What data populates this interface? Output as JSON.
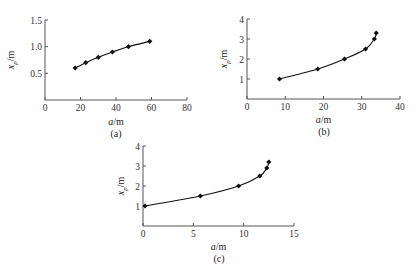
{
  "chart_data": [
    {
      "type": "line",
      "panel": "(a)",
      "xlabel": "a/m",
      "ylabel": "x_p/m",
      "xlim": [
        0,
        80
      ],
      "ylim": [
        0,
        1.5
      ],
      "xticks": [
        0,
        20,
        40,
        60,
        80
      ],
      "xtick_labels": [
        "0",
        "20",
        "40",
        "60",
        "80"
      ],
      "yticks": [
        0.5,
        1.0,
        1.5
      ],
      "ytick_labels": [
        "0.5",
        "1.0",
        "1.5"
      ],
      "grid": false,
      "marker": "diamond",
      "x": [
        17,
        23,
        30,
        38,
        47,
        59
      ],
      "y": [
        0.6,
        0.7,
        0.8,
        0.9,
        1.0,
        1.1
      ]
    },
    {
      "type": "line",
      "panel": "(b)",
      "xlabel": "a/m",
      "ylabel": "x_p/m",
      "xlim": [
        0,
        40
      ],
      "ylim": [
        0,
        4
      ],
      "xticks": [
        0,
        10,
        20,
        30,
        40
      ],
      "xtick_labels": [
        "0",
        "10",
        "20",
        "30",
        "40"
      ],
      "yticks": [
        1,
        2,
        3,
        4
      ],
      "ytick_labels": [
        "1",
        "2",
        "3",
        "4"
      ],
      "grid": false,
      "marker": "diamond",
      "x": [
        8.5,
        18.5,
        25.5,
        31,
        33.3,
        33.8
      ],
      "y": [
        1.0,
        1.5,
        2.0,
        2.5,
        3.0,
        3.3
      ]
    },
    {
      "type": "line",
      "panel": "(c)",
      "xlabel": "a/m",
      "ylabel": "x_p/m",
      "xlim": [
        0,
        15
      ],
      "ylim": [
        0,
        4
      ],
      "xticks": [
        0,
        5,
        10,
        15
      ],
      "xtick_labels": [
        "0",
        "5",
        "10",
        "15"
      ],
      "yticks": [
        1,
        2,
        3,
        4
      ],
      "ytick_labels": [
        "1",
        "2",
        "3",
        "4"
      ],
      "grid": false,
      "marker": "diamond",
      "x": [
        0.2,
        5.7,
        9.5,
        11.6,
        12.3,
        12.5
      ],
      "y": [
        1.0,
        1.5,
        2.0,
        2.5,
        2.9,
        3.2
      ]
    }
  ],
  "layout": {
    "panels": [
      {
        "x0": 45,
        "x1": 187,
        "y0": 100,
        "y1": 20,
        "label_x": 116,
        "label_y": 137,
        "xlabel_y": 125,
        "ylabel_x": 14
      },
      {
        "x0": 247,
        "x1": 400,
        "y0": 99,
        "y1": 19,
        "label_x": 324,
        "label_y": 135,
        "xlabel_y": 123,
        "ylabel_x": 227
      },
      {
        "x0": 143,
        "x1": 294,
        "y0": 226,
        "y1": 146,
        "label_x": 219,
        "label_y": 262,
        "xlabel_y": 250,
        "ylabel_x": 124
      }
    ],
    "colors": {
      "axis": "#555555",
      "line": "#111111",
      "marker": "#111111"
    }
  }
}
